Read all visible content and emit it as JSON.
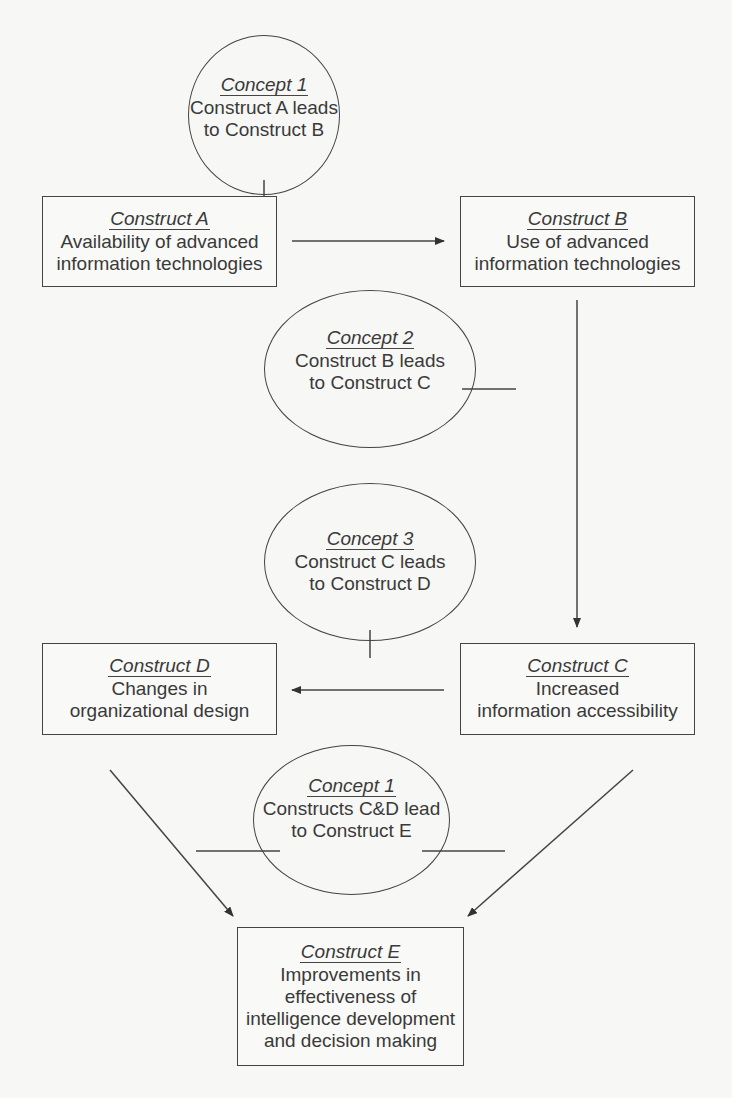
{
  "constructs": {
    "a": {
      "title": "Construct A",
      "line1": "Availability of advanced",
      "line2": "information technologies"
    },
    "b": {
      "title": "Construct B",
      "line1": "Use of advanced",
      "line2": "information technologies"
    },
    "c": {
      "title": "Construct C",
      "line1": "Increased",
      "line2": "information accessibility"
    },
    "d": {
      "title": "Construct D",
      "line1": "Changes in",
      "line2": "organizational design"
    },
    "e": {
      "title": "Construct E",
      "line1": "Improvements in",
      "line2": "effectiveness of",
      "line3": "intelligence development",
      "line4": "and decision making"
    }
  },
  "concepts": {
    "c1": {
      "title": "Concept 1",
      "line1": "Construct A leads",
      "line2": "to Construct B"
    },
    "c2": {
      "title": "Concept 2",
      "line1": "Construct B leads",
      "line2": "to Construct C"
    },
    "c3": {
      "title": "Concept 3",
      "line1": "Construct C leads",
      "line2": "to Construct D"
    },
    "c4": {
      "title": "Concept 1",
      "line1": "Constructs C&D lead",
      "line2": "to Construct E"
    }
  },
  "colors": {
    "line": "#444444",
    "background": "#f7f7f5",
    "text": "#3a3a3a"
  }
}
